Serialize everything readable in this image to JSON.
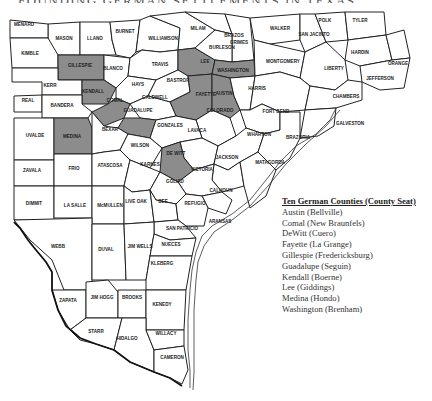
{
  "title": "FOUNDING GERMAN SETTLEMENTS IN TEXAS",
  "colors": {
    "highlight": "#8c8c8c",
    "county": "#ffffff",
    "line": "#222222"
  },
  "legend": {
    "heading": "Ten German Counties (County Seat)",
    "items": [
      "Austin (Bellville)",
      "Comal (New Braunfels)",
      "DeWitt (Cuero)",
      "Fayette (La Grange)",
      "Gillespie (Fredericksburg)",
      "Guadalupe (Seguin)",
      "Kendall (Boerne)",
      "Lee (Giddings)",
      "Medina (Hondo)",
      "Washington (Brenham)"
    ]
  },
  "counties": {
    "menard": "MENARD",
    "mason": "MASON",
    "llano": "LLANO",
    "burnet": "BURNET",
    "williamson": "WILLIAMSON",
    "milam": "MILAM",
    "brazos": "BRAZOS",
    "grimes": "GRIMES",
    "walker": "WALKER",
    "san_jacinto": "SAN JACINTO",
    "polk": "POLK",
    "tyler": "TYLER",
    "kimble": "KIMBLE",
    "gillespie": "GILLESPIE",
    "blanco": "BLANCO",
    "travis": "TRAVIS",
    "lee": "LEE",
    "burleson": "BURLESON",
    "washington": "WASHINGTON",
    "montgomery": "MONTGOMERY",
    "liberty": "LIBERTY",
    "hardin": "HARDIN",
    "orange": "ORANGE",
    "jefferson": "JEFFERSON",
    "kerr": "KERR",
    "kendall": "KENDALL",
    "hays": "HAYS",
    "bastrop": "BASTROP",
    "waller": "WALLER",
    "austin": "AUSTIN",
    "harris": "HARRIS",
    "chambers": "CHAMBERS",
    "real": "REAL",
    "bandera": "BANDERA",
    "comal": "COMAL",
    "caldwell": "CALDWELL",
    "fayette": "FAYETTE",
    "guadalupe": "GUADALUPE",
    "colorado": "COLORADO",
    "fort_bend": "FORT BEND",
    "galveston": "GALVESTON",
    "uvalde": "UVALDE",
    "medina": "MEDINA",
    "bexar": "BEXAR",
    "gonzales": "GONZALES",
    "lavaca": "LAVACA",
    "wharton": "WHARTON",
    "brazoria": "BRAZORIA",
    "wilson": "WILSON",
    "dewitt": "DE WITT",
    "zavala": "ZAVALA",
    "frio": "FRIO",
    "atascosa": "ATASCOSA",
    "karnes": "KARNES",
    "jackson": "JACKSON",
    "matagorda": "MATAGORDA",
    "victoria": "VICTORIA",
    "goliad": "GOLIAD",
    "calhoun": "CALHOUN",
    "dimmit": "DIMMIT",
    "la_salle": "LA SALLE",
    "mcmullen": "McMULLEN",
    "live_oak": "LIVE OAK",
    "bee": "BEE",
    "refugio": "REFUGIO",
    "aransas": "ARANSAS",
    "san_patricio": "SAN PATRICIO",
    "webb": "WEBB",
    "duval": "DUVAL",
    "jim_wells": "JIM WELLS",
    "nueces": "NUECES",
    "kleberg": "KLEBERG",
    "zapata": "ZAPATA",
    "jim_hogg": "JIM HOGG",
    "brooks": "BROOKS",
    "kenedy": "KENEDY",
    "starr": "STARR",
    "hidalgo": "HIDALGO",
    "willacy": "WILLACY",
    "cameron": "CAMERON"
  }
}
